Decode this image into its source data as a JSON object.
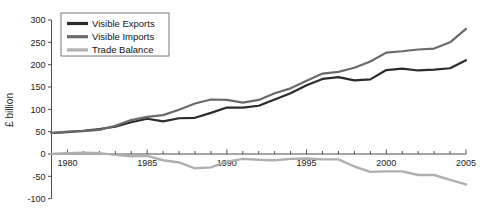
{
  "chart_data": {
    "type": "line",
    "title": "",
    "subtitle": "",
    "xlabel": "",
    "ylabel": "£ billion",
    "xlim": [
      1979,
      2005
    ],
    "ylim": [
      -100,
      300
    ],
    "ytick_step": 50,
    "xtick_step": 1,
    "xtick_label_step": 5,
    "grid": false,
    "legend_position": "top-left-inside",
    "x": [
      1979,
      1980,
      1981,
      1982,
      1983,
      1984,
      1985,
      1986,
      1987,
      1988,
      1989,
      1990,
      1991,
      1992,
      1993,
      1994,
      1995,
      1996,
      1997,
      1998,
      1999,
      2000,
      2001,
      2002,
      2003,
      2004,
      2005
    ],
    "ytick_labels": [
      "-100",
      "-50",
      "0",
      "50",
      "100",
      "150",
      "200",
      "250",
      "300"
    ],
    "ytick_values": [
      -100,
      -50,
      0,
      50,
      100,
      150,
      200,
      250,
      300
    ],
    "xtick_labels": [
      "1980",
      "1985",
      "1990",
      "1995",
      "2000",
      "2005"
    ],
    "xtick_label_values": [
      1980,
      1985,
      1990,
      1995,
      2000,
      2005
    ],
    "series": [
      {
        "name": "Visible Exports",
        "color": "#2b2b2b",
        "width": 2.2,
        "values": [
          47,
          49,
          52,
          56,
          61,
          71,
          79,
          73,
          80,
          81,
          92,
          104,
          104,
          108,
          122,
          136,
          154,
          168,
          172,
          165,
          167,
          188,
          191,
          187,
          189,
          192,
          210
        ]
      },
      {
        "name": "Visible Imports",
        "color": "#6a6a6a",
        "width": 2.2,
        "values": [
          47,
          50,
          51,
          54,
          63,
          76,
          83,
          87,
          99,
          113,
          122,
          121,
          115,
          121,
          136,
          147,
          164,
          180,
          184,
          193,
          207,
          227,
          230,
          234,
          236,
          250,
          280
        ]
      },
      {
        "name": "Trade Balance",
        "color": "#afafaf",
        "width": 2.4,
        "values": [
          0,
          2,
          3,
          2,
          -2,
          -5,
          -4,
          -14,
          -19,
          -32,
          -30,
          -17,
          -11,
          -13,
          -14,
          -11,
          -10,
          -12,
          -12,
          -28,
          -40,
          -39,
          -39,
          -47,
          -47,
          -58,
          -68
        ]
      }
    ]
  },
  "legend": {
    "items": [
      {
        "label": "Visible Exports"
      },
      {
        "label": "Visible Imports"
      },
      {
        "label": "Trade Balance"
      }
    ]
  },
  "axis": {
    "y_title": "£ billion"
  }
}
